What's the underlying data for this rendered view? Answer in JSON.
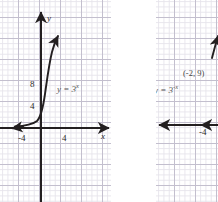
{
  "figure": {
    "type": "math-graph-pair",
    "background": "#ffffff",
    "grid_color": "#b9b4c6",
    "curve_color": "#231f20"
  },
  "panels": [
    {
      "id": "left",
      "name": "graph-growth",
      "axis_labels": {
        "x": "x",
        "y": "y"
      },
      "x_ticks": [
        {
          "label": "-4",
          "value": -4
        },
        {
          "label": "4",
          "value": 4
        }
      ],
      "y_ticks": [
        {
          "label": "4",
          "value": 4
        },
        {
          "label": "8",
          "value": 8
        }
      ],
      "equation_plain": "y = 3",
      "equation_exponent": "x",
      "curve": {
        "function": "y = 3^x",
        "behavior": "exponential growth",
        "asymptote": "y = 0",
        "arrow_start": "left along x-axis",
        "arrow_end": "upper right"
      }
    },
    {
      "id": "right",
      "name": "graph-decay",
      "axis_labels": {
        "x": "",
        "y": ""
      },
      "x_ticks": [
        {
          "label": "-4",
          "value": -4
        }
      ],
      "y_ticks": [],
      "equation_plain": "y = 3",
      "equation_exponent": "-x",
      "point_label": "(-2, 9)",
      "curve": {
        "function": "y = 3^-x",
        "behavior": "exponential decay",
        "asymptote": "y = 0",
        "arrow_start": "left along x-axis",
        "arrow_end": "upper right (clipped)"
      }
    }
  ]
}
